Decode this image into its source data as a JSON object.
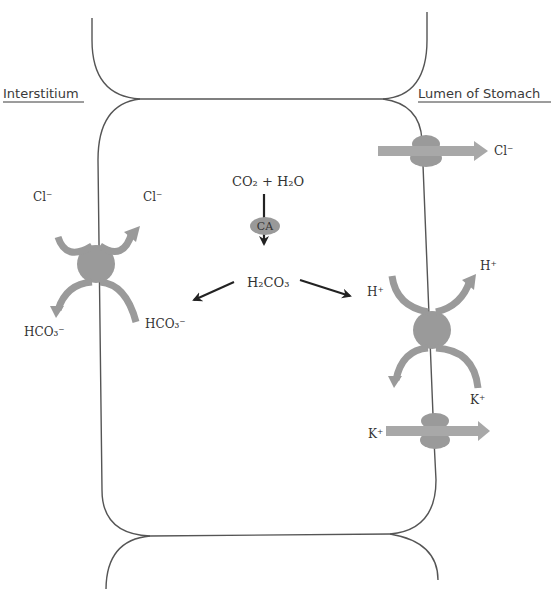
{
  "diagram": {
    "type": "gastric parietal cell ion transport",
    "regions": {
      "left": "Interstitium",
      "right": "Lumen of Stomach"
    },
    "reaction": {
      "reactants": "CO₂ + H₂O",
      "enzyme": "CA",
      "product": "H₂CO₃"
    },
    "basolateral_exchanger": {
      "in_ion_top": "Cl⁻",
      "out_ion_top": "Cl⁻",
      "in_ion_bottom": "HCO₃⁻",
      "out_ion_bottom": "HCO₃⁻"
    },
    "apical_cl_channel": {
      "ion": "Cl⁻"
    },
    "proton_pump": {
      "in_ion_top": "H⁺",
      "out_ion_top": "H⁺",
      "ion_bottom": "K⁺"
    },
    "apical_k_channel": {
      "ion": "K⁺"
    },
    "colors": {
      "membrane": "#555555",
      "transporter": "#9a9a9a",
      "text": "#333333",
      "arrow": "#222222"
    }
  }
}
